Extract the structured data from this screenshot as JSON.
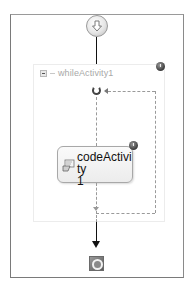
{
  "diagram": {
    "type": "sequential-workflow",
    "start": {
      "icon": "start-arrow-down-icon"
    },
    "while_activity": {
      "title": "whileActivity1",
      "collapse_icon": "collapse-minus-icon",
      "warning_icon": "warning-icon",
      "loop_icon": "loop-icon"
    },
    "code_activity": {
      "label": "codeActivity1",
      "label_line1": "codeActivity",
      "label_line2": "1",
      "icon": "code-activity-icon",
      "warning_icon": "warning-icon"
    },
    "end": {
      "icon": "end-stop-icon"
    },
    "colors": {
      "frame": "#7a7a7a",
      "connector": "#111111",
      "loop_connector": "#9a9a9a",
      "title_text": "#a8a8a8",
      "activity_text": "#111111"
    }
  }
}
